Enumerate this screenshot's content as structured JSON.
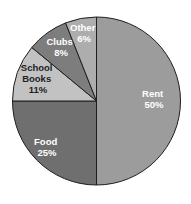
{
  "chart_data": {
    "type": "pie",
    "title": "",
    "categories": [
      "Rent",
      "Food",
      "School Books",
      "Clubs",
      "Other"
    ],
    "values": [
      50,
      25,
      11,
      8,
      6
    ],
    "labels": [
      "50%",
      "25%",
      "11%",
      "8%",
      "6%"
    ],
    "colors": [
      "#9c9c9c",
      "#6f6f6f",
      "#c2c2c2",
      "#7d7d7d",
      "#adadad"
    ],
    "label_colors": [
      "#ffffff",
      "#ffffff",
      "#222222",
      "#ffffff",
      "#ffffff"
    ],
    "start_angle_deg": 0,
    "direction": "clockwise-from-top",
    "legend": "none",
    "slice_labels": [
      {
        "line1": "Rent",
        "line2": "50%"
      },
      {
        "line1": "Food",
        "line2": "25%"
      },
      {
        "line1": "School",
        "line2": "Books",
        "line3": "11%"
      },
      {
        "line1": "Clubs",
        "line2": "8%"
      },
      {
        "line1": "Other",
        "line2": "6%"
      }
    ]
  }
}
